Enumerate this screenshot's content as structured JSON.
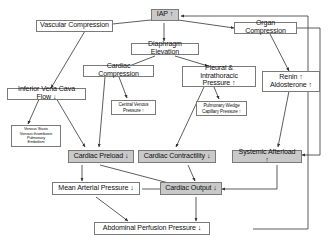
{
  "diagram": {
    "colors": {
      "box_border": "#7a7a7a",
      "box_fill": "#ffffff",
      "shaded_fill": "#c9c9c9",
      "edge": "#333333",
      "text": "#111111"
    },
    "nodes": [
      {
        "id": "iap",
        "label": "IAP ↑",
        "shaded": true,
        "size": "norm"
      },
      {
        "id": "vascular",
        "label": "Vascular Compression",
        "shaded": false,
        "size": "norm"
      },
      {
        "id": "organ",
        "label": "Organ Compression",
        "shaded": false,
        "size": "norm"
      },
      {
        "id": "diaphragm",
        "label": "Diaphragm Elevation",
        "shaded": false,
        "size": "norm"
      },
      {
        "id": "ivc",
        "label": "Inferior Vena Cava Flow ↓",
        "shaded": false,
        "size": "norm"
      },
      {
        "id": "cardiac_comp",
        "label": "Cardiac Compression",
        "shaded": false,
        "size": "norm"
      },
      {
        "id": "pleural",
        "label": "Pleural & Intrathoracic\nPressure ↑",
        "shaded": false,
        "size": "norm"
      },
      {
        "id": "renin",
        "label": "Renin ↑\nAldosterone ↑",
        "shaded": false,
        "size": "norm"
      },
      {
        "id": "cvp",
        "label": "Central Venous\nPressure ↑",
        "shaded": false,
        "size": "small"
      },
      {
        "id": "pcwp",
        "label": "Pulmonary Wedge\nCapillary Pressure ↑",
        "shaded": false,
        "size": "small"
      },
      {
        "id": "stasis",
        "label": "Venous Stasis\nVenous thrombosis\nPulmonary\nEmbolism",
        "shaded": false,
        "size": "tiny"
      },
      {
        "id": "preload",
        "label": "Cardiac Preload ↓",
        "shaded": true,
        "size": "norm"
      },
      {
        "id": "contractility",
        "label": "Cardiac Contractility ↓",
        "shaded": true,
        "size": "norm"
      },
      {
        "id": "afterload",
        "label": "Systemic Afterload ↑",
        "shaded": true,
        "size": "norm"
      },
      {
        "id": "map",
        "label": "Mean Arterial Pressure ↓",
        "shaded": false,
        "size": "norm"
      },
      {
        "id": "co",
        "label": "Cardiac Output ↓",
        "shaded": true,
        "size": "norm"
      },
      {
        "id": "app",
        "label": "Abdominal Perfusion Pressure ↓",
        "shaded": false,
        "size": "norm"
      }
    ],
    "edges": [
      {
        "from": "iap",
        "to": "vascular"
      },
      {
        "from": "iap",
        "to": "organ"
      },
      {
        "from": "iap",
        "to": "diaphragm"
      },
      {
        "from": "vascular",
        "to": "ivc"
      },
      {
        "from": "diaphragm",
        "to": "cardiac_comp"
      },
      {
        "from": "diaphragm",
        "to": "pleural"
      },
      {
        "from": "organ",
        "to": "renin"
      },
      {
        "from": "organ",
        "to": "afterload"
      },
      {
        "from": "ivc",
        "to": "stasis"
      },
      {
        "from": "ivc",
        "to": "preload"
      },
      {
        "from": "cardiac_comp",
        "to": "cvp"
      },
      {
        "from": "cardiac_comp",
        "to": "contractility"
      },
      {
        "from": "pleural",
        "to": "pcwp"
      },
      {
        "from": "pleural",
        "to": "contractility"
      },
      {
        "from": "renin",
        "to": "afterload"
      },
      {
        "from": "preload",
        "to": "co"
      },
      {
        "from": "preload",
        "to": "map"
      },
      {
        "from": "contractility",
        "to": "co"
      },
      {
        "from": "afterload",
        "to": "co"
      },
      {
        "from": "map",
        "to": "co"
      },
      {
        "from": "map",
        "to": "app"
      },
      {
        "from": "co",
        "to": "app"
      },
      {
        "from": "app",
        "to": "iap"
      }
    ]
  }
}
